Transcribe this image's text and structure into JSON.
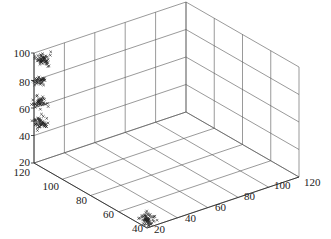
{
  "chart_data": {
    "type": "scatter3d",
    "title": "",
    "xlabel": "",
    "ylabel": "",
    "zlabel": "",
    "marker": "x",
    "grid": true,
    "x_ticks": [
      "20",
      "40",
      "60",
      "80",
      "100",
      "120"
    ],
    "y_ticks": [
      "40",
      "60",
      "80",
      "100",
      "120"
    ],
    "z_ticks": [
      "20",
      "40",
      "60",
      "80",
      "100"
    ],
    "xlim": [
      20,
      120
    ],
    "ylim": [
      40,
      120
    ],
    "zlim": [
      20,
      100
    ],
    "clusters": [
      {
        "name": "cluster-1",
        "center": [
          22,
          42,
          25
        ],
        "count": 60
      },
      {
        "name": "cluster-2",
        "center": [
          22,
          118,
          50
        ],
        "count": 50
      },
      {
        "name": "cluster-3",
        "center": [
          22,
          118,
          65
        ],
        "count": 45
      },
      {
        "name": "cluster-4",
        "center": [
          22,
          118,
          80
        ],
        "count": 35
      },
      {
        "name": "cluster-5",
        "center": [
          24,
          118,
          95
        ],
        "count": 55
      }
    ]
  },
  "labels": {
    "z": [
      "100",
      "80",
      "60",
      "40",
      "20"
    ],
    "y": [
      "120",
      "100",
      "80",
      "60",
      "40"
    ],
    "x": [
      "20",
      "40",
      "60",
      "80",
      "100",
      "120"
    ]
  }
}
